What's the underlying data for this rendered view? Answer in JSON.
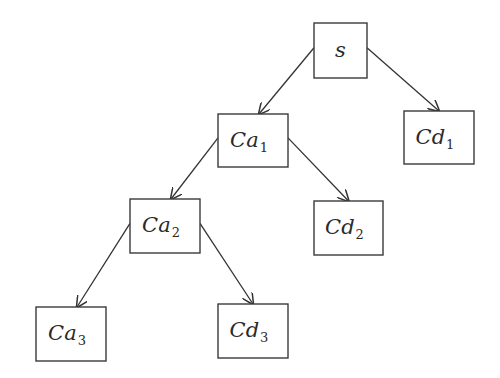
{
  "diagram": {
    "type": "tree",
    "nodes": [
      {
        "id": "s",
        "base": "s",
        "sub": "",
        "x": 314,
        "y": 23,
        "w": 53,
        "h": 55
      },
      {
        "id": "Ca1",
        "base": "Ca",
        "sub": "1",
        "x": 218,
        "y": 114,
        "w": 70,
        "h": 53
      },
      {
        "id": "Cd1",
        "base": "Cd",
        "sub": "1",
        "x": 404,
        "y": 111,
        "w": 70,
        "h": 53
      },
      {
        "id": "Ca2",
        "base": "Ca",
        "sub": "2",
        "x": 130,
        "y": 199,
        "w": 70,
        "h": 54
      },
      {
        "id": "Cd2",
        "base": "Cd",
        "sub": "2",
        "x": 314,
        "y": 201,
        "w": 69,
        "h": 54
      },
      {
        "id": "Ca3",
        "base": "Ca",
        "sub": "3",
        "x": 36,
        "y": 307,
        "w": 70,
        "h": 54
      },
      {
        "id": "Cd3",
        "base": "Cd",
        "sub": "3",
        "x": 218,
        "y": 304,
        "w": 70,
        "h": 54
      }
    ],
    "edges": [
      {
        "from": "s",
        "to": "Ca1"
      },
      {
        "from": "s",
        "to": "Cd1"
      },
      {
        "from": "Ca1",
        "to": "Ca2"
      },
      {
        "from": "Ca1",
        "to": "Cd2"
      },
      {
        "from": "Ca2",
        "to": "Ca3"
      },
      {
        "from": "Ca2",
        "to": "Cd3"
      }
    ],
    "labels": {
      "s": "s",
      "Ca1": "Ca1",
      "Cd1": "Cd1",
      "Ca2": "Ca2",
      "Cd2": "Cd2",
      "Ca3": "Ca3",
      "Cd3": "Cd3"
    }
  }
}
